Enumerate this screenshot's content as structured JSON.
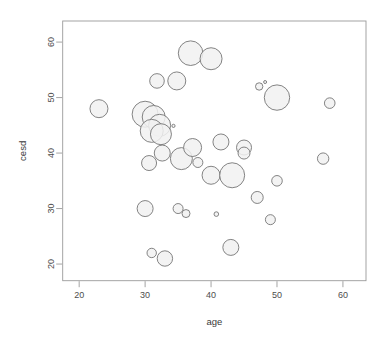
{
  "chart_data": {
    "type": "scatter",
    "title": "",
    "subtitle": "",
    "xlabel": "age",
    "ylabel": "cesd",
    "xlim": [
      17.5,
      63.5
    ],
    "ylim": [
      17.0,
      63.8
    ],
    "xticks": [
      20,
      30,
      40,
      50,
      60
    ],
    "yticks": [
      20,
      30,
      40,
      50,
      60
    ],
    "xtick_labels": [
      "20",
      "30",
      "40",
      "50",
      "60"
    ],
    "ytick_labels": [
      "20",
      "30",
      "40",
      "50",
      "60"
    ],
    "grid": false,
    "legend": null,
    "size_encoding": "bubble radius encodes a third variable",
    "marker": {
      "shape": "circle",
      "fill_color": "#f1f1f1",
      "edge_color": "#6e6e6e",
      "edge_width": 0.85,
      "fill_opacity": 0.85
    },
    "points": [
      {
        "x": 23.0,
        "y": 48.0,
        "r": 9.0
      },
      {
        "x": 30.0,
        "y": 47.0,
        "r": 13.0
      },
      {
        "x": 31.3,
        "y": 46.5,
        "r": 11.5
      },
      {
        "x": 32.2,
        "y": 45.0,
        "r": 11.0
      },
      {
        "x": 31.0,
        "y": 44.0,
        "r": 11.5
      },
      {
        "x": 32.4,
        "y": 43.4,
        "r": 10.5
      },
      {
        "x": 34.3,
        "y": 44.9,
        "r": 1.6
      },
      {
        "x": 31.8,
        "y": 53.0,
        "r": 7.3
      },
      {
        "x": 34.8,
        "y": 53.0,
        "r": 9.0
      },
      {
        "x": 36.9,
        "y": 58.0,
        "r": 12.3
      },
      {
        "x": 40.0,
        "y": 57.0,
        "r": 11.0
      },
      {
        "x": 30.6,
        "y": 38.2,
        "r": 7.5
      },
      {
        "x": 32.6,
        "y": 40.0,
        "r": 8.0
      },
      {
        "x": 35.5,
        "y": 39.0,
        "r": 11.0
      },
      {
        "x": 37.2,
        "y": 41.0,
        "r": 9.0
      },
      {
        "x": 38.0,
        "y": 38.3,
        "r": 5.0
      },
      {
        "x": 40.0,
        "y": 36.0,
        "r": 9.0
      },
      {
        "x": 43.2,
        "y": 36.0,
        "r": 12.5
      },
      {
        "x": 41.5,
        "y": 42.0,
        "r": 8.0
      },
      {
        "x": 45.0,
        "y": 41.0,
        "r": 7.5
      },
      {
        "x": 45.0,
        "y": 40.0,
        "r": 6.0
      },
      {
        "x": 47.3,
        "y": 52.0,
        "r": 3.7
      },
      {
        "x": 48.2,
        "y": 52.8,
        "r": 1.5
      },
      {
        "x": 50.0,
        "y": 50.0,
        "r": 12.7
      },
      {
        "x": 58.0,
        "y": 49.0,
        "r": 5.3
      },
      {
        "x": 57.0,
        "y": 39.0,
        "r": 5.7
      },
      {
        "x": 50.0,
        "y": 35.0,
        "r": 5.3
      },
      {
        "x": 47.0,
        "y": 32.0,
        "r": 6.0
      },
      {
        "x": 49.0,
        "y": 28.0,
        "r": 5.0
      },
      {
        "x": 30.0,
        "y": 30.0,
        "r": 8.0
      },
      {
        "x": 35.0,
        "y": 30.0,
        "r": 5.0
      },
      {
        "x": 36.2,
        "y": 29.1,
        "r": 4.0
      },
      {
        "x": 40.8,
        "y": 29.0,
        "r": 2.3
      },
      {
        "x": 43.0,
        "y": 23.0,
        "r": 8.0
      },
      {
        "x": 31.0,
        "y": 22.0,
        "r": 4.7
      },
      {
        "x": 33.0,
        "y": 21.0,
        "r": 7.7
      }
    ]
  },
  "axes": {
    "x_title": "age",
    "y_title": "cesd"
  },
  "colors": {
    "frame": "#9a9a9a",
    "tick_label": "#4d4d4d",
    "axis_title": "#3a3a3a",
    "bubble_fill": "#f1f1f1",
    "bubble_edge": "#6e6e6e",
    "background": "#ffffff"
  }
}
